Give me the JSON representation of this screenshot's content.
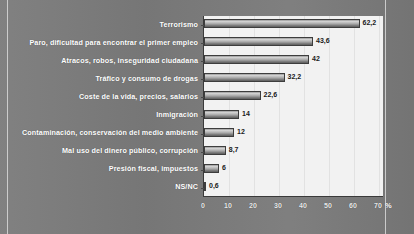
{
  "chart_data": {
    "type": "bar",
    "orientation": "horizontal",
    "title": "",
    "xlabel": "%",
    "ylabel": "",
    "xlim": [
      0,
      72
    ],
    "xticks": [
      "0",
      "10",
      "20",
      "30",
      "40",
      "50",
      "60",
      "70"
    ],
    "xtick_values": [
      0,
      10,
      20,
      30,
      40,
      50,
      60,
      70
    ],
    "grid": true,
    "legend": "none",
    "axis_unit": "%",
    "categories": [
      "Terrorismo",
      "Paro, dificultad para encontrar el primer empleo",
      "Atracos, robos, inseguridad ciudadana",
      "Tráfico y consumo de drogas",
      "Coste de la vida, precios, salarios",
      "Inmigración",
      "Contaminación, conservación del medio ambiente",
      "Mal uso del dinero público, corrupción",
      "Presión fiscal, impuestos",
      "NS/NC"
    ],
    "values": [
      62.2,
      43.6,
      42,
      32.2,
      22.6,
      14,
      12,
      8.7,
      6,
      0.6
    ],
    "value_labels": [
      "62,2",
      "43,6",
      "42",
      "32,2",
      "22,6",
      "14",
      "12",
      "8,7",
      "6",
      "0,6"
    ]
  },
  "colors": {
    "page_background": "#7a7a7a",
    "plot_background": "#f2f2f2",
    "bar_fill": "#a8a8a8",
    "bar_border": "#3d3d3d",
    "label_text": "#ffffff",
    "value_text": "#1a1a1a",
    "gridline": "#e2e2e2"
  }
}
